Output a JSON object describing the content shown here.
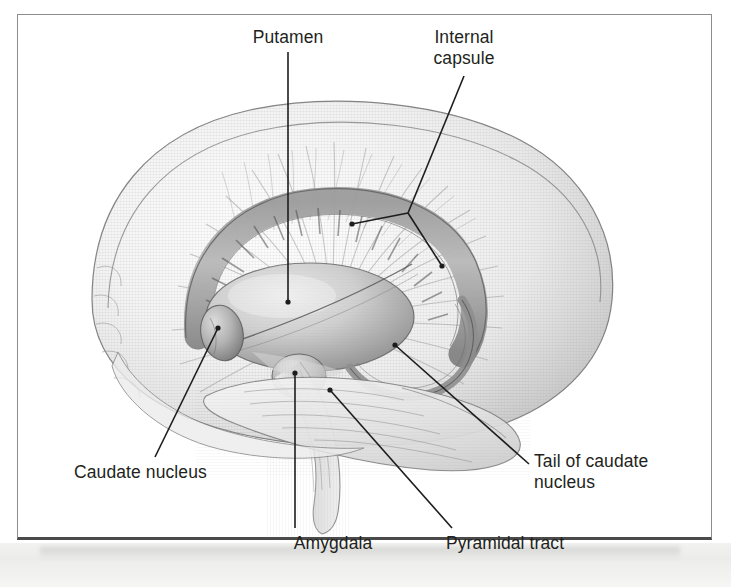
{
  "figure": {
    "frame_color": "#8d8d8d",
    "frame_bottom_color": "#4a4a4a",
    "background_color": "#ffffff",
    "ink_color": "#231f20",
    "leader_color": "#1d1d1d"
  },
  "labels": [
    {
      "id": "putamen",
      "text": "Putamen",
      "lines": [
        "Putamen"
      ],
      "align": "center",
      "leader": {
        "type": "straight",
        "from": [
          288,
          52
        ],
        "to": [
          288,
          302
        ],
        "endpoint_dot": true
      }
    },
    {
      "id": "internal-capsule",
      "text": "Internal capsule",
      "lines": [
        "Internal",
        "capsule"
      ],
      "align": "center",
      "leader": {
        "type": "branched",
        "from": [
          464,
          76
        ],
        "joint": [
          408,
          213
        ],
        "to_a": [
          352,
          224
        ],
        "to_b": [
          442,
          266
        ],
        "endpoint_dot": true
      }
    },
    {
      "id": "caudate-nucleus",
      "text": "Caudate nucleus",
      "lines": [
        "Caudate nucleus"
      ],
      "align": "left",
      "leader": {
        "type": "straight",
        "from": [
          155,
          457
        ],
        "to": [
          218,
          328
        ],
        "endpoint_dot": true
      }
    },
    {
      "id": "amygdala",
      "text": "Amygdala",
      "lines": [
        "Amygdala"
      ],
      "align": "center",
      "leader": {
        "type": "straight",
        "from": [
          295,
          528
        ],
        "to": [
          295,
          373
        ],
        "endpoint_dot": true
      }
    },
    {
      "id": "pyramidal-tract",
      "text": "Pyramidal tract",
      "lines": [
        "Pyramidal tract"
      ],
      "align": "center",
      "leader": {
        "type": "straight",
        "from": [
          452,
          528
        ],
        "to": [
          330,
          390
        ],
        "endpoint_dot": true
      }
    },
    {
      "id": "tail-of-caudate-nucleus",
      "text": "Tail of caudate nucleus",
      "lines": [
        "Tail of caudate",
        "nucleus"
      ],
      "align": "left",
      "leader": {
        "type": "straight",
        "from": [
          529,
          464
        ],
        "to": [
          395,
          345
        ],
        "endpoint_dot": true
      }
    }
  ],
  "structures": [
    {
      "name": "cerebral-hemisphere-outline",
      "description": "translucent grey cerebral hemisphere seen from the left side"
    },
    {
      "name": "corona-radiata-fibers",
      "description": "fan of radiating white matter fibres (internal capsule continuation)"
    },
    {
      "name": "caudate-nucleus-body",
      "description": "C-shaped striated nucleus arching over the putamen"
    },
    {
      "name": "caudate-nucleus-head",
      "description": "bulbous anterior head of the caudate, lower left"
    },
    {
      "name": "caudate-nucleus-tail",
      "description": "thin tail curving down and forward at the right"
    },
    {
      "name": "putamen-body",
      "description": "large smooth ovoid lens-shaped nucleus at centre"
    },
    {
      "name": "amygdala-body",
      "description": "small rounded nucleus beneath the putamen"
    },
    {
      "name": "brainstem",
      "description": "midbrain, pons and medulla descending below the nuclei"
    },
    {
      "name": "cerebellum",
      "description": "folded lobe at lower right of the hemisphere"
    }
  ]
}
